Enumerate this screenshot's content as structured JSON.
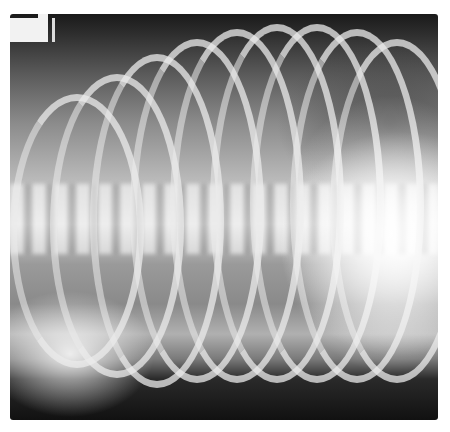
{
  "image": {
    "description": "Lateral-oblique radiograph of thorax showing curved ribs, vertebral column, and radiopaque marker in top-left corner",
    "colors": {
      "background": "#ffffff",
      "dark_edge": "#111111",
      "bone": "#ebebeb"
    }
  }
}
